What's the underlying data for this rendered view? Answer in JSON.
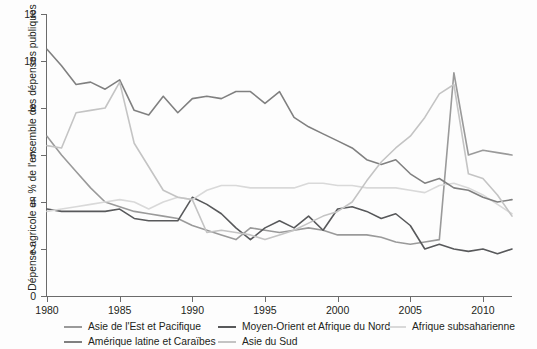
{
  "chart_data": {
    "type": "line",
    "title": "",
    "subtitle": "",
    "xlabel": "",
    "ylabel": "Dépense agricole en % de l'ensemble des dépenses publiques",
    "xlim": [
      1980,
      2012
    ],
    "ylim": [
      0,
      12
    ],
    "grid": false,
    "legend_position": "bottom",
    "x_ticks": [
      1980,
      1985,
      1990,
      1995,
      2000,
      2005,
      2010
    ],
    "x_tick_labels": [
      "1980",
      "1985",
      "1990",
      "1995",
      "2000",
      "2005",
      "2010"
    ],
    "y_ticks": [
      0,
      2,
      4,
      6,
      8,
      10,
      12
    ],
    "y_tick_labels": [
      "0",
      "2",
      "4",
      "6",
      "8",
      "10",
      "12"
    ],
    "x": [
      1980,
      1981,
      1982,
      1983,
      1984,
      1985,
      1986,
      1987,
      1988,
      1989,
      1990,
      1991,
      1992,
      1993,
      1994,
      1995,
      1996,
      1997,
      1998,
      1999,
      2000,
      2001,
      2002,
      2003,
      2004,
      2005,
      2006,
      2007,
      2008,
      2009,
      2010,
      2011,
      2012
    ],
    "series": [
      {
        "name": "Asie de l'Est et Pacifique",
        "color": "#9a9a9a",
        "values": [
          6.8,
          6.0,
          5.3,
          4.6,
          4.0,
          3.8,
          3.6,
          3.5,
          3.4,
          3.3,
          3.0,
          2.8,
          2.6,
          2.4,
          2.9,
          2.8,
          2.7,
          2.8,
          2.9,
          2.8,
          2.6,
          2.6,
          2.6,
          2.5,
          2.3,
          2.2,
          2.3,
          2.4,
          9.5,
          6.0,
          6.2,
          6.1,
          6.0
        ]
      },
      {
        "name": "Moyen-Orient et Afrique du Nord",
        "color": "#58595b",
        "values": [
          3.7,
          3.6,
          3.6,
          3.6,
          3.6,
          3.7,
          3.3,
          3.2,
          3.2,
          3.2,
          4.2,
          3.9,
          3.5,
          2.9,
          2.4,
          2.9,
          3.2,
          2.9,
          3.4,
          2.8,
          3.7,
          3.8,
          3.6,
          3.3,
          3.5,
          3.0,
          2.0,
          2.2,
          2.0,
          1.9,
          2.0,
          1.8,
          2.0
        ]
      },
      {
        "name": "Afrique subsaharienne",
        "color": "#d9d9d9",
        "values": [
          3.6,
          3.7,
          3.8,
          3.9,
          4.0,
          4.1,
          4.0,
          3.7,
          4.0,
          4.2,
          4.1,
          4.5,
          4.7,
          4.7,
          4.6,
          4.6,
          4.6,
          4.6,
          4.8,
          4.8,
          4.7,
          4.7,
          4.6,
          4.6,
          4.6,
          4.5,
          4.4,
          4.7,
          4.8,
          4.6,
          4.3,
          3.9,
          3.5
        ]
      },
      {
        "name": "Amérique latine et Caraïbes",
        "color": "#808080",
        "values": [
          10.5,
          9.8,
          9.0,
          9.1,
          8.8,
          9.2,
          7.9,
          7.7,
          8.5,
          7.8,
          8.4,
          8.5,
          8.4,
          8.7,
          8.7,
          8.2,
          8.7,
          7.6,
          7.2,
          6.9,
          6.6,
          6.3,
          5.8,
          5.6,
          5.8,
          5.2,
          4.8,
          5.0,
          4.6,
          4.5,
          4.2,
          4.0,
          4.1
        ]
      },
      {
        "name": "Asie du Sud",
        "color": "#c4c4c4",
        "values": [
          6.4,
          6.3,
          7.8,
          7.9,
          8.0,
          9.1,
          6.5,
          5.5,
          4.5,
          4.2,
          4.1,
          2.7,
          2.8,
          2.7,
          2.6,
          2.4,
          2.6,
          2.8,
          3.1,
          3.4,
          3.6,
          4.0,
          4.9,
          5.7,
          6.3,
          6.8,
          7.6,
          8.6,
          9.0,
          5.2,
          5.0,
          4.3,
          3.4
        ]
      }
    ]
  },
  "axis": {
    "y_title": "Dépense agricole en % de l'ensemble des dépenses publiques",
    "y_labels": [
      "12",
      "10",
      "8",
      "6",
      "4",
      "2",
      "0"
    ],
    "x_labels": [
      "1980",
      "1985",
      "1990",
      "1995",
      "2000",
      "2005",
      "2010"
    ]
  },
  "legend": {
    "rows": [
      [
        {
          "label": "Asie de l'Est et Pacifique",
          "color": "#9a9a9a",
          "left": 64
        },
        {
          "label": "Moyen-Orient et Afrique du Nord",
          "color": "#58595b",
          "left": 218
        },
        {
          "label": "Afrique subsaharienne",
          "color": "#d9d9d9",
          "left": 388
        }
      ],
      [
        {
          "label": "Amérique latine et Caraïbes",
          "color": "#808080",
          "left": 64
        },
        {
          "label": "Asie du Sud",
          "color": "#c4c4c4",
          "left": 218
        }
      ]
    ]
  }
}
